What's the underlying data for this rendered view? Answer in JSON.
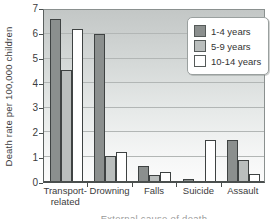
{
  "figure": {
    "y_axis_title": "Death rate per 100,000 children",
    "x_caption_partial": "External cause of death"
  },
  "chart_data": {
    "type": "bar",
    "title": "",
    "xlabel": "",
    "ylabel": "Death rate per 100,000 children",
    "ylim": [
      0,
      7
    ],
    "yticks": [
      0,
      1,
      2,
      3,
      4,
      5,
      6,
      7
    ],
    "grid": true,
    "legend_position": "upper right",
    "categories": [
      "Transport-related",
      "Drowning",
      "Falls",
      "Suicide",
      "Assault"
    ],
    "series": [
      {
        "name": "1-4 years",
        "color": "#8b8f8e",
        "values": [
          6.6,
          6.0,
          0.6,
          0.05,
          1.65
        ]
      },
      {
        "name": "5-9 years",
        "color": "#babebd",
        "values": [
          4.5,
          1.0,
          0.25,
          0,
          0.85
        ]
      },
      {
        "name": "10-14 years",
        "color": "#ffffff",
        "values": [
          6.2,
          1.2,
          0.35,
          1.65,
          0.3
        ]
      }
    ],
    "colors": {
      "bar_border": "#3e4242",
      "gridline": "#b2b6b5",
      "axis": "#4a4f4e",
      "plot_bg_top": "#c3c7c6",
      "plot_bg_bottom": "#fbfbfb",
      "legend_border": "#9aa09f",
      "text": "#3c3c3c"
    }
  }
}
